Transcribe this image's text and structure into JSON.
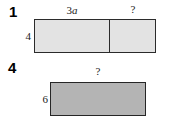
{
  "figure": {
    "type": "area-model-diagram",
    "caption_context": "Two rectangle area models with labeled side lengths",
    "problems": [
      {
        "number": "1",
        "rectangle": {
          "style": "split-into-two-parts",
          "fill_color": "#e3e3e3",
          "border_color": "#2b2b2b",
          "height_label": "4",
          "part_labels": [
            "3a",
            "?"
          ],
          "part_label_1_plain": "3",
          "part_label_1_italic": "a",
          "part_label_2": "?"
        }
      },
      {
        "number": "4",
        "rectangle": {
          "style": "single",
          "fill_color": "#b4b4b4",
          "border_color": "#262626",
          "height_label": "6",
          "width_label": "?"
        }
      }
    ]
  }
}
